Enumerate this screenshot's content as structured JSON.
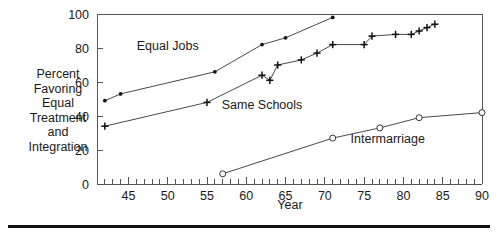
{
  "figure": {
    "ylabel_lines": [
      "Percent",
      "Favoring",
      "Equal",
      "Treatment",
      "and",
      "Integration"
    ],
    "xlabel": "Year",
    "bottom_rule": true
  },
  "chart_data": {
    "type": "line",
    "title": "",
    "xlabel": "Year",
    "ylabel": "Percent Favoring Equal Treatment and Integration",
    "xlim": [
      41,
      90
    ],
    "ylim": [
      0,
      100
    ],
    "xticks": [
      45,
      50,
      55,
      60,
      65,
      70,
      75,
      80,
      85,
      90
    ],
    "xtick_labels": [
      "45",
      "50",
      "55",
      "60",
      "65",
      "70",
      "75",
      "80",
      "85",
      "90"
    ],
    "minor_xticks_every": 1,
    "yticks": [
      0,
      20,
      40,
      60,
      80,
      100
    ],
    "ytick_labels": [
      "0",
      "20",
      "40",
      "60",
      "80",
      "100"
    ],
    "grid": false,
    "legend": "inline-annotations",
    "series": [
      {
        "name": "Equal Jobs",
        "marker": "filled-dot",
        "label_x": 50,
        "label_y": 79,
        "x": [
          42,
          44,
          56,
          62,
          65,
          71
        ],
        "y": [
          49,
          53,
          66,
          82,
          86,
          98
        ]
      },
      {
        "name": "Same Schools",
        "marker": "plus",
        "label_x": 62,
        "label_y": 44,
        "x": [
          42,
          55,
          62,
          63,
          64,
          67,
          69,
          71,
          75,
          76,
          79,
          81,
          82,
          83,
          84
        ],
        "y": [
          34,
          48,
          64,
          61,
          70,
          73,
          77,
          82,
          82,
          87,
          88,
          88,
          90,
          92,
          94
        ]
      },
      {
        "name": "Intermarriage",
        "marker": "open-circle",
        "label_x": 78,
        "label_y": 24,
        "x": [
          57,
          71,
          77,
          82,
          90
        ],
        "y": [
          6,
          27,
          33,
          39,
          42
        ]
      }
    ]
  }
}
